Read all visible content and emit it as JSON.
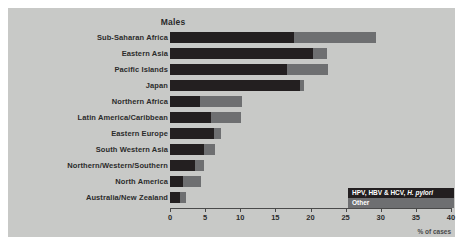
{
  "chart_data": {
    "type": "bar",
    "orientation": "horizontal",
    "stacked": true,
    "title": "Males",
    "xlabel": "% of cases",
    "ylabel": "",
    "xlim": [
      0,
      40
    ],
    "xticks": [
      0,
      5,
      10,
      15,
      20,
      25,
      30,
      35,
      40
    ],
    "grid": false,
    "legend_position": "bottom-right",
    "categories": [
      "Sub-Saharan Africa",
      "Eastern Asia",
      "Pacific Islands",
      "Japan",
      "Northern Africa",
      "Latin America/Caribbean",
      "Eastern Europe",
      "South Western Asia",
      "Northern/Western/Southern",
      "North America",
      "Australia/New Zealand"
    ],
    "series": [
      {
        "name": "HPV, HBV & HCV, H. pylori",
        "color": "#231f20",
        "values": [
          17.6,
          20.3,
          16.7,
          18.5,
          4.3,
          5.8,
          6.3,
          4.8,
          3.6,
          1.8,
          1.4
        ]
      },
      {
        "name": "Other",
        "color": "#6e6f71",
        "values": [
          11.7,
          2.0,
          5.8,
          0.6,
          5.9,
          4.3,
          1.0,
          1.6,
          1.2,
          2.6,
          0.9
        ]
      }
    ],
    "totals": [
      29.3,
      22.3,
      22.5,
      19.1,
      10.2,
      10.1,
      7.3,
      6.4,
      4.8,
      4.4,
      2.3
    ]
  },
  "legend": {
    "infection_label_prefix": "HPV, HBV & HCV, ",
    "infection_label_italic": "H. pylori",
    "other_label": "Other"
  },
  "colors": {
    "panel_background": "#c8c9c7",
    "page_background": "#ffffff",
    "infection": "#231f20",
    "other": "#6e6f71",
    "axis": "#4a4a4a",
    "text": "#2b2b2b"
  }
}
